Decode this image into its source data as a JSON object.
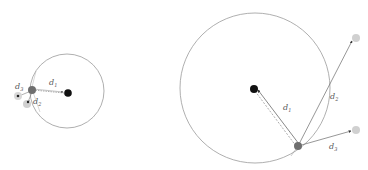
{
  "colors": {
    "circle_stroke": "#9a9a9a",
    "line": "#7a7a7a",
    "center_dot": "#111111",
    "query_dot": "#6e6e6e",
    "neighbor_dot": "#d0d0d0",
    "label": "#555555"
  },
  "left_diagram": {
    "labels": {
      "d1": {
        "base": "d",
        "sub": "1"
      },
      "d2": {
        "base": "d",
        "sub": "2"
      },
      "d3": {
        "base": "d",
        "sub": "3"
      }
    }
  },
  "right_diagram": {
    "labels": {
      "d1": {
        "base": "d",
        "sub": "1"
      },
      "d2": {
        "base": "d",
        "sub": "2"
      },
      "d3": {
        "base": "d",
        "sub": "3"
      }
    }
  }
}
